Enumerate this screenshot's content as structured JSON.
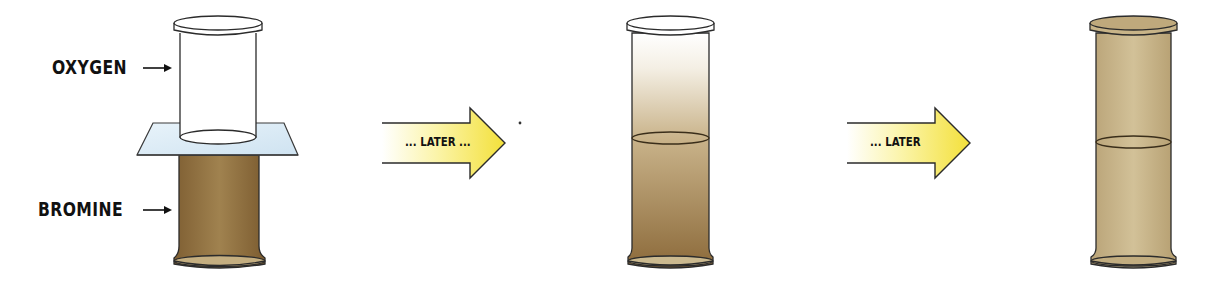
{
  "diagram": {
    "stages": [
      {
        "id": "start",
        "top_gas": "oxygen",
        "bottom_gas": "bromine"
      },
      {
        "id": "middle",
        "description": "bromine partially diffused upward"
      },
      {
        "id": "end",
        "description": "bromine evenly mixed throughout both jars"
      }
    ],
    "labels": {
      "oxygen": "OXYGEN",
      "bromine": "BROMINE"
    },
    "arrows": [
      {
        "text": "... LATER ..."
      },
      {
        "text": "... LATER"
      }
    ],
    "colors": {
      "bromine_dark": "#8a6a3c",
      "bromine_mid": "#b39a6e",
      "bromine_light": "#d4c29c",
      "glass_plate": "#dcecf6",
      "arrow_yellow": "#f6e84a",
      "outline": "#2b2b2b"
    }
  }
}
